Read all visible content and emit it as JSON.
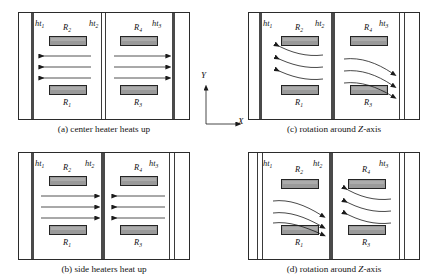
{
  "figure": {
    "type": "schematic-diagram"
  },
  "colors": {
    "wall": "#3a3a3a",
    "heater_fill": "#9a9a9a",
    "heater_border": "#242424",
    "frame": "#2b2b2b",
    "arrow": "#1a1a1a",
    "background": "#ffffff"
  },
  "axes": {
    "x_label": "X",
    "y_label": "Y"
  },
  "labels": {
    "ht1": "ht",
    "ht1_sub": "1",
    "ht2": "ht",
    "ht2_sub": "2",
    "ht3": "ht",
    "ht3_sub": "3",
    "R1": "R",
    "R1_sub": "1",
    "R2": "R",
    "R2_sub": "2",
    "R3": "R",
    "R3_sub": "3",
    "R4": "R",
    "R4_sub": "4"
  },
  "panels": [
    {
      "id": "a",
      "caption_prefix": "(a) center heater heats up",
      "caption_plain": "(a) center heater heats up",
      "flow_type": "straight",
      "left_cell_direction": "left",
      "right_cell_direction": "right",
      "arrow_count": 3
    },
    {
      "id": "b",
      "caption_prefix": "(b) side heaters heat up",
      "caption_plain": "(b) side heaters heat up",
      "flow_type": "straight",
      "left_cell_direction": "right",
      "right_cell_direction": "left",
      "arrow_count": 3
    },
    {
      "id": "c",
      "caption_plain": "(c) rotation around Z-axis",
      "caption_pre": "(c) rotation around ",
      "caption_ital": "Z",
      "caption_post": "-axis",
      "flow_type": "curved",
      "left_cell_direction": "up-left",
      "right_cell_direction": "down-right",
      "arrow_count": 3
    },
    {
      "id": "d",
      "caption_plain": "(d) rotation around Z-axis",
      "caption_pre": "(d) rotation around ",
      "caption_ital": "Z",
      "caption_post": "-axis",
      "flow_type": "curved",
      "left_cell_direction": "down-right",
      "right_cell_direction": "up-left",
      "arrow_count": 3
    }
  ]
}
